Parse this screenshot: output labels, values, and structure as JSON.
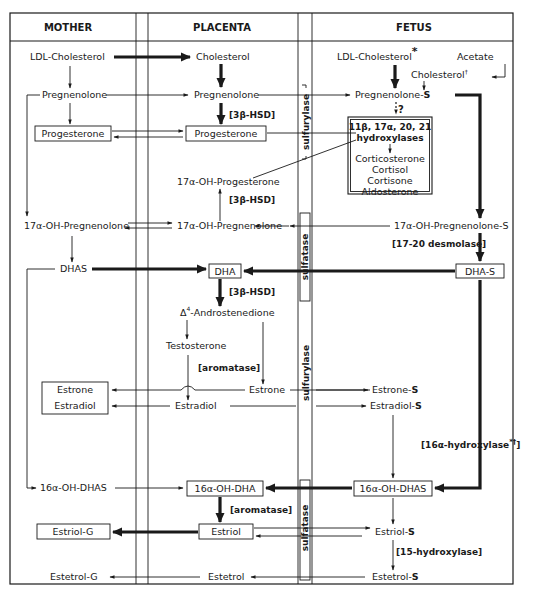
{
  "columns": {
    "mother": "MOTHER",
    "placenta": "PLACENTA",
    "fetus": "FETUS"
  },
  "mother": {
    "ldl_cholesterol": "LDL-Cholesterol",
    "pregnenolone": "Pregnenolone",
    "progesterone": "Progesterone",
    "oh17_pregnenolone": "17α-OH-Pregnenolone",
    "dhas": "DHAS",
    "estrone": "Estrone",
    "estradiol": "Estradiol",
    "oh16_dhas": "16α-OH-DHAS",
    "estriol_g": "Estriol-G",
    "estetrol_g": "Estetrol-G"
  },
  "placenta": {
    "cholesterol": "Cholesterol",
    "pregnenolone": "Pregnenolone",
    "enzyme_3b_hsd_1": "[3β-HSD]",
    "progesterone": "Progesterone",
    "oh17_progesterone": "17α-OH-Progesterone",
    "enzyme_3b_hsd_2": "[3β-HSD]",
    "oh17_pregnenolone": "17α-OH-Pregnenolone",
    "dha": "DHA",
    "enzyme_3b_hsd_3": "[3β-HSD]",
    "androstenedione": "Δ4-Androstenedione",
    "androstenedione_delta": "Δ",
    "androstenedione_sup": "4",
    "androstenedione_rest": "-Androstenedione",
    "testosterone": "Testosterone",
    "enzyme_aromatase_1": "[aromatase]",
    "estrone": "Estrone",
    "estradiol": "Estradiol",
    "oh16_dha": "16α-OH-DHA",
    "enzyme_aromatase_2": "[aromatase]",
    "estriol": "Estriol",
    "estetrol": "Estetrol"
  },
  "barrier": {
    "sulfurylase_1": "sulfurylase",
    "sulfatase_1": "sulfatase",
    "sulfurylase_2": "sulfurylase",
    "sulfatase_2": "sulfatase"
  },
  "fetus": {
    "ldl_cholesterol": "LDL-Cholesterol",
    "ldl_mark": "*",
    "acetate": "Acetate",
    "cholesterol": "Cholesterol",
    "cholesterol_mark": "†",
    "pregnenolone_s": "Pregnenolone-",
    "s_suffix": "S",
    "question": "?",
    "hydroxylases_title": "11β, 17α, 20, 21",
    "hydroxylases_sub": "hydroxylases",
    "products": [
      "Corticosterone",
      "Cortisol",
      "Cortisone",
      "Aldosterone"
    ],
    "oh17_pregnenolone_s": "17α-OH-Pregnenolone-S",
    "enzyme_desmolase": "[17-20 desmolase]",
    "dha_s": "DHA-S",
    "estrone_s": "Estrone-",
    "estradiol_s": "Estradiol-",
    "enzyme_16a_hydroxylase": "[16α-hydroxylase",
    "enzyme_16a_marks": "*†",
    "enzyme_16a_close": "]",
    "oh16_dhas": "16α-OH-DHAS",
    "estriol_s": "Estriol-",
    "enzyme_15_hydroxylase": "[15-hydroxylase]",
    "estetrol_s": "Estetrol-"
  }
}
